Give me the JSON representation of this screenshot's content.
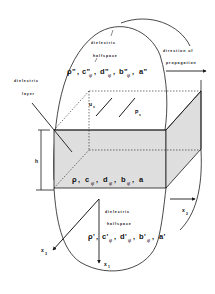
{
  "diagram": {
    "type": "layered medium schematic",
    "labels": {
      "upper_region_line1": "dielectric",
      "upper_region_line2": "halfspace",
      "layer_line1": "dielectric",
      "layer_line2": "layer",
      "lower_region_line1": "dielectric",
      "lower_region_line2": "halfspace",
      "propagation_line1": "direction of",
      "propagation_line2": "propagation",
      "thickness": "h"
    },
    "upper_params": {
      "rho": "ρ\"",
      "c": "c\"",
      "c_sub": "ijl",
      "d": "d\"",
      "d_sub": "ijl",
      "b": "b\"",
      "b_sub": "ijl",
      "a": "a\""
    },
    "layer_params": {
      "rho": "ρ",
      "c": "c",
      "c_sub": "ijl",
      "d": "d",
      "d_sub": "ijl",
      "b": "b",
      "b_sub": "ijl",
      "a": "a"
    },
    "lower_params": {
      "rho": "ρ'",
      "c": "c'",
      "c_sub": "ijl",
      "d": "d'",
      "d_sub": "ijl",
      "b": "b'",
      "b_sub": "ijl",
      "a": "a'"
    },
    "vectors": {
      "u": "u",
      "u_sub": "s",
      "p": "P",
      "p_sub": "s"
    },
    "axes": {
      "x1": "x",
      "x1_sub": "1",
      "x2": "x",
      "x2_sub": "2",
      "x3": "x",
      "x3_sub": "3"
    },
    "colors": {
      "line": "#1a1a1a",
      "layer_fill": "#dcdcdc",
      "background": "#ffffff"
    }
  }
}
